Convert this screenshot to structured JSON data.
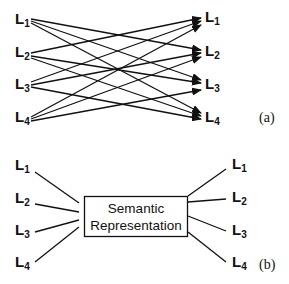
{
  "panel_a": {
    "caption": "(a)",
    "left_labels": [
      {
        "base": "L",
        "sub": "1"
      },
      {
        "base": "L",
        "sub": "2"
      },
      {
        "base": "L",
        "sub": "3"
      },
      {
        "base": "L",
        "sub": "4"
      }
    ],
    "right_labels": [
      {
        "base": "L",
        "sub": "1"
      },
      {
        "base": "L",
        "sub": "2"
      },
      {
        "base": "L",
        "sub": "3"
      },
      {
        "base": "L",
        "sub": "4"
      }
    ],
    "description": "Fully connected directed mapping: each source language L_i has an arrow to every other target language L_j (i != j)"
  },
  "panel_b": {
    "caption": "(b)",
    "box_label_line1": "Semantic",
    "box_label_line2": "Representation",
    "left_labels": [
      {
        "base": "L",
        "sub": "1"
      },
      {
        "base": "L",
        "sub": "2"
      },
      {
        "base": "L",
        "sub": "3"
      },
      {
        "base": "L",
        "sub": "4"
      }
    ],
    "right_labels": [
      {
        "base": "L",
        "sub": "1"
      },
      {
        "base": "L",
        "sub": "2"
      },
      {
        "base": "L",
        "sub": "3"
      },
      {
        "base": "L",
        "sub": "4"
      }
    ],
    "description": "Each language connects to a central Semantic Representation (interlingua)"
  }
}
